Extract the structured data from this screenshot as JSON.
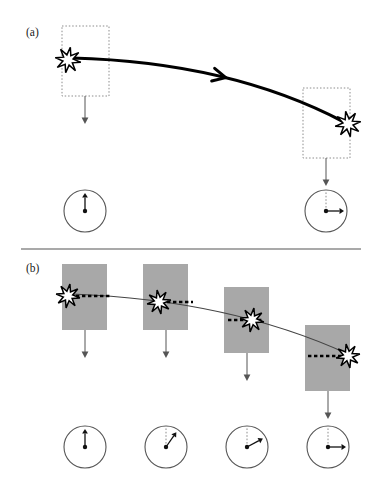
{
  "figure": {
    "background_color": "#ffffff",
    "width": 384,
    "height": 485,
    "divider": {
      "name": "panel-divider",
      "x1": 21,
      "x2": 361,
      "y": 249,
      "color": "#555555",
      "stroke_width": 1.1
    }
  },
  "style": {
    "ink": "#1a1a1a",
    "gray_box_fill": "#a8a8a8",
    "dotted_box_stroke": "#8c8c8c",
    "trajectory_color": "#000000",
    "thin_curve_color": "#444444",
    "dial_stroke": "#555555",
    "dial_fill": "#ffffff",
    "star_fill": "#ffffff",
    "star_stroke": "#000000",
    "gravity_arrow_color": "#555555",
    "dashed_ref_color": "#000000"
  },
  "panel_a": {
    "label": "(a)",
    "label_x": 26,
    "label_y": 36,
    "description": "Two snapshots of a burst travelling along a thick curved trajectory; dotted outline boxes mark the reference frame, dials below show orientation",
    "boxes": [
      {
        "name": "dotted-box-a1",
        "x": 62,
        "y": 26,
        "width": 47,
        "height": 70
      },
      {
        "name": "dotted-box-a2",
        "x": 303,
        "y": 88,
        "width": 47,
        "height": 70
      }
    ],
    "stars": [
      {
        "name": "burst-a1",
        "cx": 68,
        "cy": 60,
        "radius": 13
      },
      {
        "name": "burst-a2",
        "cx": 348,
        "cy": 124,
        "radius": 13
      }
    ],
    "trajectory": {
      "name": "trajectory-curve-a",
      "start_x": 72,
      "start_y": 58,
      "control_x": 230,
      "control_y": 62,
      "end_x": 344,
      "end_y": 122,
      "stroke_width": 3.2,
      "arrow_at_t": 0.5
    },
    "gravity_arrows": [
      {
        "name": "gravity-arrow-a1",
        "x": 85,
        "y1": 96,
        "y2": 124
      },
      {
        "name": "gravity-arrow-a2",
        "x": 326,
        "y1": 158,
        "y2": 186
      }
    ],
    "dials": [
      {
        "name": "dial-a1",
        "cx": 85,
        "cy": 211,
        "r": 21,
        "angle_deg": 0,
        "reference_line": false
      },
      {
        "name": "dial-a2",
        "cx": 326,
        "cy": 211,
        "r": 21,
        "angle_deg": 90,
        "reference_line": true
      }
    ]
  },
  "panel_b": {
    "label": "(b)",
    "label_x": 26,
    "label_y": 272,
    "description": "Four snapshots stepping downward along a thin curved trajectory; solid gray boxes mark the reference frame, dashed horizontal lines mark the local level, dials below show progressive rotation",
    "boxes": [
      {
        "name": "gray-box-b1",
        "x": 62,
        "y": 264,
        "width": 45,
        "height": 66
      },
      {
        "name": "gray-box-b2",
        "x": 143,
        "y": 264,
        "width": 45,
        "height": 66
      },
      {
        "name": "gray-box-b3",
        "x": 224,
        "y": 287,
        "width": 45,
        "height": 66
      },
      {
        "name": "gray-box-b4",
        "x": 305,
        "y": 325,
        "width": 45,
        "height": 66
      }
    ],
    "stars": [
      {
        "name": "burst-b1",
        "cx": 68,
        "cy": 296,
        "radius": 12
      },
      {
        "name": "burst-b2",
        "cx": 159,
        "cy": 302,
        "radius": 12
      },
      {
        "name": "burst-b3",
        "cx": 252,
        "cy": 320,
        "radius": 12
      },
      {
        "name": "burst-b4",
        "cx": 348,
        "cy": 356,
        "radius": 12
      }
    ],
    "dashed_refs": [
      {
        "name": "level-line-b1",
        "x1": 76,
        "x2": 110,
        "y": 296
      },
      {
        "name": "level-line-b2",
        "x1": 167,
        "x2": 193,
        "y": 302
      },
      {
        "name": "level-line-b3",
        "x1": 228,
        "x2": 262,
        "y": 320
      },
      {
        "name": "level-line-b4",
        "x1": 308,
        "x2": 344,
        "y": 356
      }
    ],
    "trajectory": {
      "name": "trajectory-curve-b",
      "start_x": 72,
      "start_y": 294,
      "control_x": 230,
      "control_y": 300,
      "end_x": 348,
      "end_y": 354,
      "stroke_width": 1.2
    },
    "gravity_arrows": [
      {
        "name": "gravity-arrow-b1",
        "x": 85,
        "y1": 330,
        "y2": 358
      },
      {
        "name": "gravity-arrow-b2",
        "x": 166,
        "y1": 330,
        "y2": 358
      },
      {
        "name": "gravity-arrow-b3",
        "x": 247,
        "y1": 353,
        "y2": 381
      },
      {
        "name": "gravity-arrow-b4",
        "x": 328,
        "y1": 391,
        "y2": 419
      }
    ],
    "dials": [
      {
        "name": "dial-b1",
        "cx": 85,
        "cy": 447,
        "r": 21,
        "angle_deg": 0,
        "reference_line": false
      },
      {
        "name": "dial-b2",
        "cx": 166,
        "cy": 447,
        "r": 21,
        "angle_deg": 35,
        "reference_line": true
      },
      {
        "name": "dial-b3",
        "cx": 247,
        "cy": 447,
        "r": 21,
        "angle_deg": 62,
        "reference_line": true
      },
      {
        "name": "dial-b4",
        "cx": 328,
        "cy": 447,
        "r": 21,
        "angle_deg": 90,
        "reference_line": true
      }
    ]
  }
}
